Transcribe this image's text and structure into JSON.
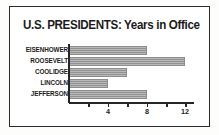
{
  "chart_data": {
    "type": "bar",
    "orientation": "horizontal",
    "title": "U.S. PRESIDENTS: Years in Office",
    "xlabel": "",
    "ylabel": "",
    "categories": [
      "EISENHOWER",
      "ROOSEVELT",
      "COOLIDGE",
      "LINCOLN",
      "JEFFERSON"
    ],
    "values": [
      8,
      12,
      6,
      4,
      8
    ],
    "xlim": [
      0,
      13
    ],
    "xticks": [
      2,
      4,
      6,
      8,
      10,
      12
    ],
    "xtick_labels": [
      "",
      "4",
      "",
      "8",
      "",
      "12"
    ],
    "labeled_xticks": [
      {
        "value": 4,
        "label": "4"
      },
      {
        "value": 8,
        "label": "8"
      },
      {
        "value": 12,
        "label": "12"
      }
    ],
    "grid": false,
    "legend": null,
    "bar_color": "#9a9a9a",
    "bar_pattern": "horizontal-hatch",
    "axis_color": "#262626",
    "background_color": "#ffffff",
    "border_color": "#2b2b2b"
  }
}
